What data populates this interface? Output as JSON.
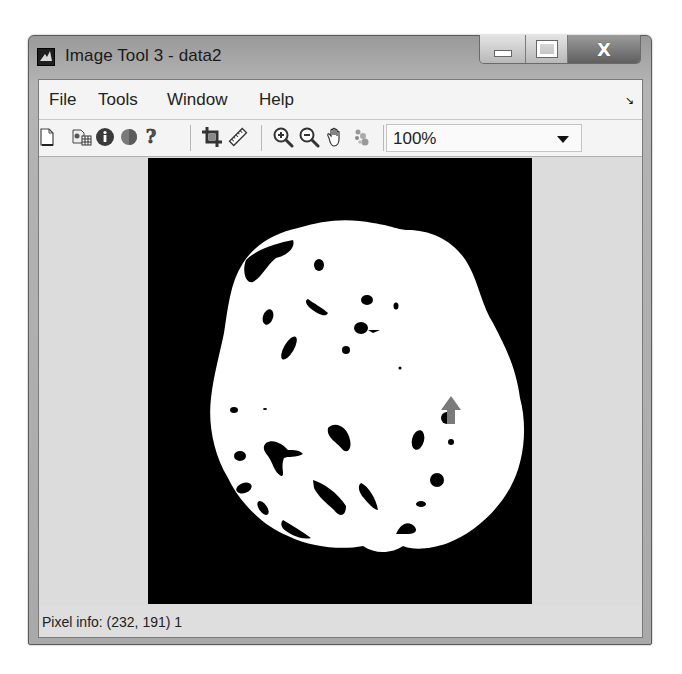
{
  "window": {
    "title": "Image Tool 3 - data2",
    "icon": "matlab-logo-icon",
    "caption_buttons": {
      "minimize": "minimize-icon",
      "maximize": "maximize-icon",
      "close": "close-icon",
      "close_glyph": "X"
    }
  },
  "menubar": {
    "items": [
      {
        "label": "File"
      },
      {
        "label": "Tools"
      },
      {
        "label": "Window"
      },
      {
        "label": "Help"
      }
    ],
    "dock_glyph": "↘"
  },
  "toolbar": {
    "buttons": [
      {
        "name": "new-figure",
        "icon": "document-icon"
      },
      {
        "name": "export-to-workspace",
        "icon": "workspace-export-icon"
      },
      {
        "name": "image-information",
        "icon": "info-icon"
      },
      {
        "name": "adjust-contrast",
        "icon": "contrast-icon"
      },
      {
        "name": "help",
        "icon": "help-icon"
      },
      {
        "name": "crop-image",
        "icon": "crop-icon"
      },
      {
        "name": "measure-distance",
        "icon": "ruler-icon"
      },
      {
        "name": "zoom-in",
        "icon": "zoom-in-icon"
      },
      {
        "name": "zoom-out",
        "icon": "zoom-out-icon"
      },
      {
        "name": "pan",
        "icon": "hand-icon"
      },
      {
        "name": "pixel-region",
        "icon": "pixel-region-icon"
      }
    ],
    "magnification": {
      "value": "100%"
    }
  },
  "image": {
    "description": "binary segmentation mask of axial brain slice",
    "background_color": "#000000",
    "foreground_color": "#ffffff",
    "cursor": "arrow-cursor-icon"
  },
  "statusbar": {
    "pixel_info": "Pixel info: (232, 191)  1"
  }
}
